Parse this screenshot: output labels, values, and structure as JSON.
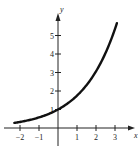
{
  "chart_data": {
    "type": "line",
    "title": "",
    "xlabel": "x",
    "ylabel": "y",
    "xlim": [
      -2.3,
      3.6
    ],
    "ylim": [
      -0.3,
      6.3
    ],
    "grid": false,
    "legend": null,
    "x_ticks": [
      -2,
      -1,
      1,
      2,
      3
    ],
    "x_tick_labels": [
      "−2",
      "−1",
      "1",
      "2",
      "3"
    ],
    "y_ticks": [
      1,
      2,
      3,
      4,
      5
    ],
    "y_tick_labels": [
      "1",
      "2",
      "3",
      "4",
      "5"
    ],
    "function": "y = a^x, a ≈ 1.75 (exponential growth, passes through (0,1))",
    "series": [
      {
        "name": "exponential curve",
        "x": [
          -2.3,
          -2,
          -1,
          0,
          1,
          2,
          3,
          3.1
        ],
        "y": [
          0.28,
          0.33,
          0.57,
          1.0,
          1.75,
          3.06,
          5.36,
          5.67
        ]
      }
    ],
    "colors": {
      "curve": "#111111",
      "axes": "#222222"
    }
  }
}
